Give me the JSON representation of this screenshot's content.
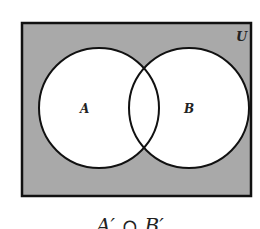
{
  "diagram": {
    "type": "venn",
    "universe_label": "U",
    "sets": [
      {
        "label": "A",
        "cx": 99,
        "cy": 108,
        "r": 60
      },
      {
        "label": "B",
        "cx": 189,
        "cy": 108,
        "r": 60
      }
    ],
    "shaded_region": "outside A and B",
    "shade_color": "#a9a9a9",
    "caption": "A′ ∩ B′"
  }
}
